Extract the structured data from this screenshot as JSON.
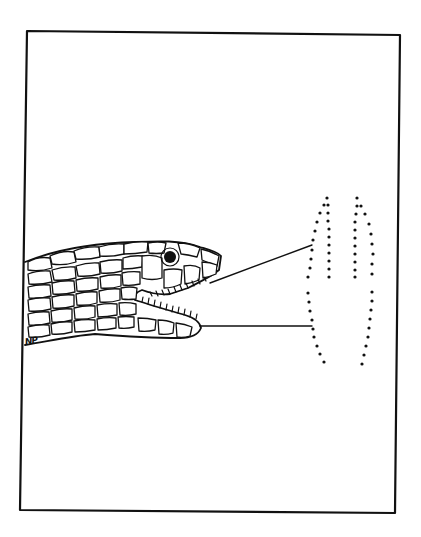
{
  "figure": {
    "type": "line-drawing",
    "signature": "NP",
    "colors": {
      "ink": "#111111",
      "paper": "#ffffff"
    },
    "frame": {
      "top_left": [
        27,
        31
      ],
      "top_right": [
        400,
        35
      ],
      "bottom_right": [
        395,
        513
      ],
      "bottom_left": [
        20,
        510
      ]
    },
    "callouts": [
      {
        "name": "upper-jaw-line",
        "from": [
          210,
          283
        ],
        "to": [
          312,
          245
        ]
      },
      {
        "name": "lower-jaw-line",
        "from": [
          200,
          326
        ],
        "to": [
          312,
          326
        ]
      }
    ],
    "dotted_outlines": [
      {
        "name": "left-dotted-outline",
        "description": "upper-jaw tooth row outline"
      },
      {
        "name": "right-dotted-outline",
        "description": "lower-jaw tooth row outline"
      }
    ]
  }
}
